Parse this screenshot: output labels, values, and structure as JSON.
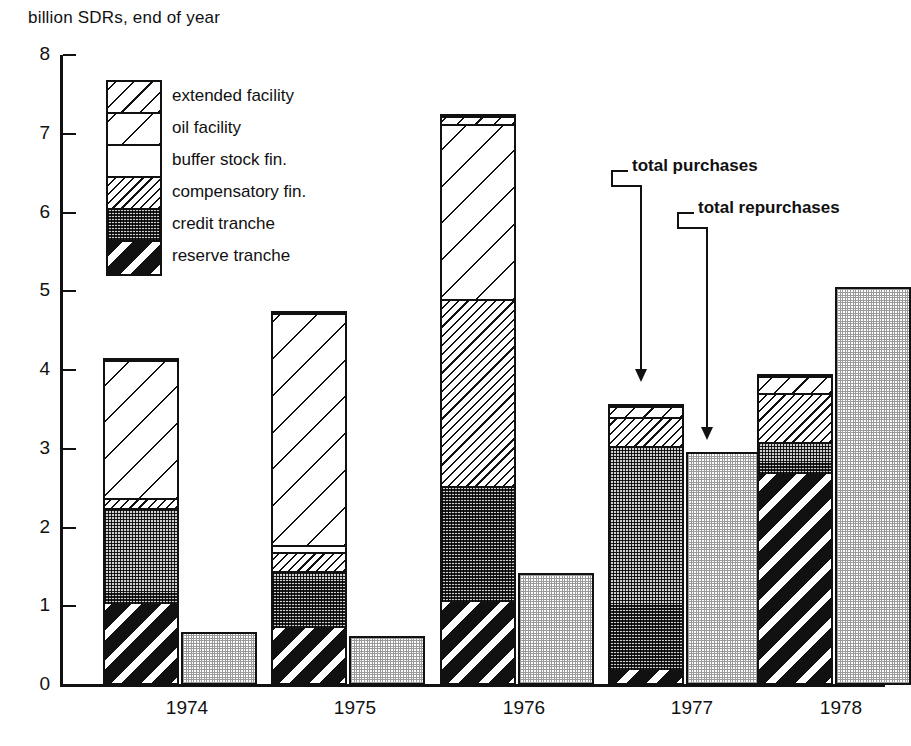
{
  "caption": "billion SDRs, end of year",
  "legend": {
    "items": [
      {
        "label": "extended facility",
        "pattern": "pat-extended"
      },
      {
        "label": "oil facility",
        "pattern": "pat-oil"
      },
      {
        "label": "buffer stock fin.",
        "pattern": "pat-buffer"
      },
      {
        "label": "compensatory fin.",
        "pattern": "pat-compensatory"
      },
      {
        "label": "credit tranche",
        "pattern": "pat-credit"
      },
      {
        "label": "reserve tranche",
        "pattern": "pat-reserve"
      }
    ]
  },
  "annotations": [
    {
      "label": "total purchases",
      "target": "1977-purchases-bar"
    },
    {
      "label": "total repurchases",
      "target": "1977-repurchases-bar"
    }
  ],
  "axis": {
    "y_ticks": [
      "8",
      "7",
      "6",
      "5",
      "4",
      "3",
      "2",
      "1",
      "0"
    ],
    "x_ticks": [
      "1974",
      "1975",
      "1976",
      "1977",
      "1978"
    ]
  },
  "chart_data": {
    "type": "bar",
    "title": "",
    "subtitle": "billion SDRs, end of year",
    "xlabel": "",
    "ylabel": "billion SDRs",
    "ylim": [
      0,
      8
    ],
    "ytick_step": 1,
    "grid": false,
    "legend_position": "inside-upper-left",
    "stacked": true,
    "categories": [
      "1974",
      "1975",
      "1976",
      "1977",
      "1978"
    ],
    "series": [
      {
        "name": "reserve tranche",
        "group": "purchases",
        "values": [
          1.05,
          0.75,
          1.08,
          0.22,
          2.7
        ]
      },
      {
        "name": "credit tranche",
        "group": "purchases",
        "values": [
          1.22,
          0.72,
          1.47,
          2.84,
          0.41
        ]
      },
      {
        "name": "compensatory fin.",
        "group": "purchases",
        "values": [
          0.13,
          0.25,
          2.38,
          0.37,
          0.62
        ]
      },
      {
        "name": "buffer stock fin.",
        "group": "purchases",
        "values": [
          0.0,
          0.08,
          0.0,
          0.0,
          0.0
        ]
      },
      {
        "name": "oil facility",
        "group": "purchases",
        "values": [
          1.75,
          2.95,
          2.22,
          0.0,
          0.0
        ]
      },
      {
        "name": "extended facility",
        "group": "purchases",
        "values": [
          0.0,
          0.0,
          0.1,
          0.14,
          0.22
        ]
      },
      {
        "name": "total repurchases",
        "group": "repurchases",
        "values": [
          0.67,
          0.62,
          1.42,
          2.96,
          5.05
        ]
      }
    ],
    "totals": {
      "total purchases": [
        4.15,
        4.75,
        7.25,
        3.57,
        3.95
      ],
      "total repurchases": [
        0.67,
        0.62,
        1.42,
        2.96,
        5.05
      ]
    }
  },
  "geometry": {
    "baseline_y": 685,
    "px_per_unit": 78.75,
    "axis_x": 60,
    "group_x": [
      103,
      271,
      440,
      608,
      757
    ],
    "purchase_bar_width": 76,
    "repurchase_bar_width": 76,
    "repurchase_offset": 78
  }
}
